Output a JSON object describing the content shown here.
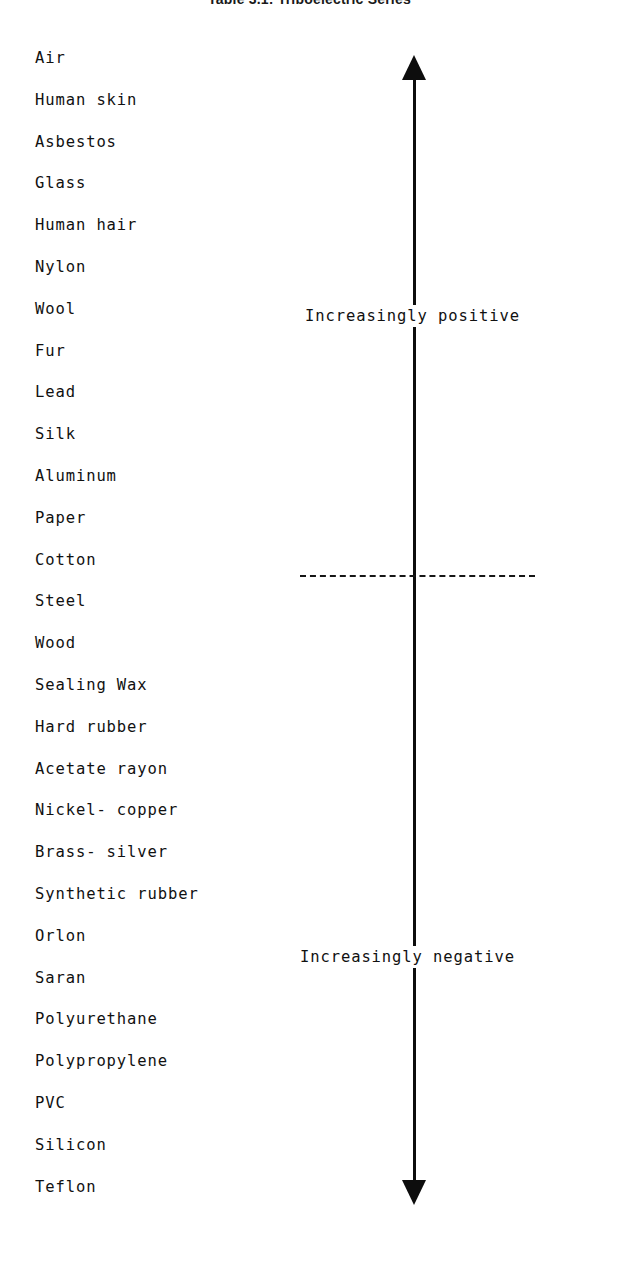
{
  "title": "Table 3.1: Triboelectric Series",
  "chart_data": {
    "type": "table",
    "title": "Table 3.1: Triboelectric Series",
    "xlabel": "",
    "ylabel": "Triboelectric charge polarity",
    "orientation": "vertical",
    "axis": {
      "top_arrow": true,
      "bottom_arrow": true,
      "top_annotation": "Increasingly positive",
      "bottom_annotation": "Increasingly negative",
      "neutral_divider": true,
      "neutral_divider_between": [
        "Cotton",
        "Steel"
      ]
    },
    "categories": [
      "Air",
      "Human skin",
      "Asbestos",
      "Glass",
      "Human hair",
      "Nylon",
      "Wool",
      "Fur",
      "Lead",
      "Silk",
      "Aluminum",
      "Paper",
      "Cotton",
      "Steel",
      "Wood",
      "Sealing Wax",
      "Hard rubber",
      "Acetate rayon",
      "Nickel- copper",
      "Brass- silver",
      "Synthetic rubber",
      "Orlon",
      "Saran",
      "Polyurethane",
      "Polypropylene",
      "PVC",
      "Silicon",
      "Teflon"
    ],
    "values": [
      1,
      2,
      3,
      4,
      5,
      6,
      7,
      8,
      9,
      10,
      11,
      12,
      13,
      14,
      15,
      16,
      17,
      18,
      19,
      20,
      21,
      22,
      23,
      24,
      25,
      26,
      27,
      28
    ]
  },
  "materials": [
    {
      "label": "Air"
    },
    {
      "label": "Human skin"
    },
    {
      "label": "Asbestos"
    },
    {
      "label": "Glass"
    },
    {
      "label": "Human hair"
    },
    {
      "label": "Nylon"
    },
    {
      "label": "Wool"
    },
    {
      "label": "Fur"
    },
    {
      "label": "Lead"
    },
    {
      "label": "Silk"
    },
    {
      "label": "Aluminum"
    },
    {
      "label": "Paper"
    },
    {
      "label": "Cotton"
    },
    {
      "label": "Steel"
    },
    {
      "label": "Wood"
    },
    {
      "label": "Sealing Wax"
    },
    {
      "label": "Hard rubber"
    },
    {
      "label": "Acetate rayon"
    },
    {
      "label": "Nickel- copper"
    },
    {
      "label": "Brass- silver"
    },
    {
      "label": "Synthetic rubber"
    },
    {
      "label": "Orlon"
    },
    {
      "label": "Saran"
    },
    {
      "label": "Polyurethane"
    },
    {
      "label": "Polypropylene"
    },
    {
      "label": "PVC"
    },
    {
      "label": "Silicon"
    },
    {
      "label": "Teflon"
    }
  ],
  "axis": {
    "positive_label": "Increasingly positive",
    "negative_label": "Increasingly negative"
  },
  "colors": {
    "ink": "#111111",
    "axis": "#0d0d0d",
    "background": "#ffffff"
  }
}
